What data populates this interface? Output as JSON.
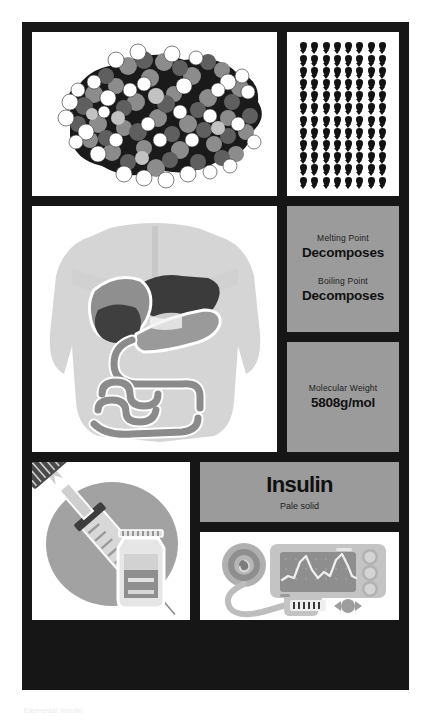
{
  "poster": {
    "compound": {
      "name": "Insulin",
      "description": "Pale solid"
    },
    "properties": [
      {
        "label": "Melting Point",
        "value": "Decomposes"
      },
      {
        "label": "Boiling Point",
        "value": "Decomposes"
      }
    ],
    "molecular_weight": {
      "label": "Molecular Weight",
      "value": "5808g/mol"
    },
    "panels": [
      {
        "id": "molecule",
        "icon": "space-filling-molecule-model",
        "background": "#ffffff"
      },
      {
        "id": "droplets",
        "icon": "water-droplet-grid",
        "background": "#ffffff",
        "droplet_rows": 12,
        "droplet_columns": 8
      },
      {
        "id": "anatomy",
        "icon": "human-torso-digestive-organs",
        "background": "#ffffff"
      },
      {
        "id": "syringe",
        "icon": "syringe-and-vial",
        "background": "#ffffff"
      },
      {
        "id": "monitor",
        "icon": "glucose-monitor-device",
        "background": "#ffffff"
      }
    ],
    "colors": {
      "frame": "#161616",
      "panel_gray": "#9b9b9b",
      "panel_white": "#ffffff",
      "ink": "#111111"
    }
  },
  "caption": "Elemental Insulin"
}
